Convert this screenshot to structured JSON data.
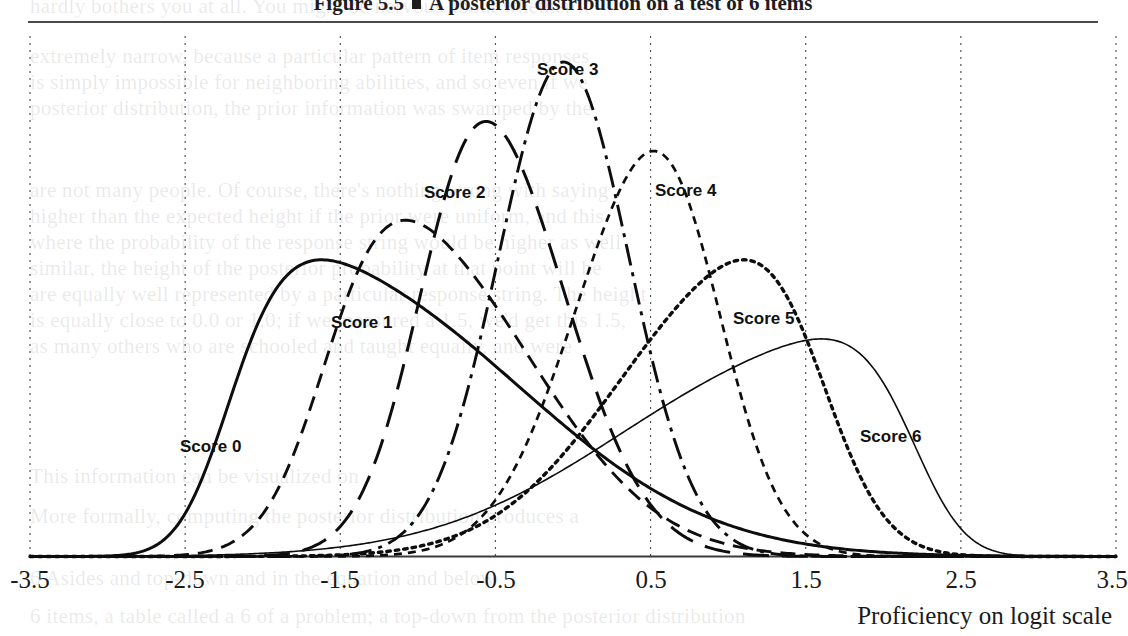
{
  "figure": {
    "number": "Figure 5.5",
    "bullet": "square-marker",
    "title": "A posterior distribution on a test of 6 items"
  },
  "axis": {
    "x_title": "Proficiency on logit scale",
    "tick_labels": [
      "-3.5",
      "-2.5",
      "-1.5",
      "-0.5",
      "0.5",
      "1.5",
      "2.5",
      "3.5"
    ]
  },
  "curve_labels": {
    "s0": "Score 0",
    "s1": "Score 1",
    "s2": "Score 2",
    "s3": "Score 3",
    "s4": "Score 4",
    "s5": "Score 5",
    "s6": "Score 6"
  },
  "bleed_text": {
    "l1": "hardly bothers you at all. You might be nervous about whether it",
    "l2": "extremely narrow, because a particular pattern of item responses",
    "l3": "is simply impossible for neighboring abilities, and so even if we",
    "l4": "posterior distribution, the prior information was swamped by the",
    "l5": "are not many people. Of course, there's nothing wrong with saying",
    "l6": "higher than the expected height if the prior were uniform, and this",
    "l7": "where the probability of the response string would be higher as well",
    "l8": "similar, the height of the posterior probability at that point will be",
    "l9": "are equally well represented by a particular response string. The height",
    "l10": "is equally close to 0.0 or 1.0; if we measured a 1.5, we'd get this 1.5,",
    "l11": "as many others who are schooled and taught equally, and were",
    "l12": "This information can be visualized on",
    "l13": "More formally, computing the posterior distribution produces a",
    "l14": "6 Asides and top-down and in the equation and below",
    "l15": "6 items, a table called a 6 of a problem; a top-down from the posterior distribution"
  },
  "chart_data": {
    "type": "line",
    "title": "A posterior distribution on a test of 6 items",
    "xlabel": "Proficiency on logit scale",
    "ylabel": "",
    "xlim": [
      -3.5,
      3.5
    ],
    "ylim": [
      0,
      1
    ],
    "grid": true,
    "legend": "inline-labels",
    "tick_values": [
      -3.5,
      -2.5,
      -1.5,
      -0.5,
      0.5,
      1.5,
      2.5,
      3.5
    ],
    "series": [
      {
        "name": "Score 0",
        "peak_x": -1.62,
        "peak_y": 0.6,
        "sigma": 0.8,
        "skew": 0.55,
        "style": "solid"
      },
      {
        "name": "Score 1",
        "peak_x": -1.08,
        "peak_y": 0.68,
        "sigma": 0.62,
        "skew": 0.3,
        "style": "dashed"
      },
      {
        "name": "Score 2",
        "peak_x": -0.56,
        "peak_y": 0.88,
        "sigma": 0.46,
        "skew": 0.12,
        "style": "long-dash"
      },
      {
        "name": "Score 3",
        "peak_x": -0.06,
        "peak_y": 1.0,
        "sigma": 0.42,
        "skew": 0.0,
        "style": "dash-dot"
      },
      {
        "name": "Score 4",
        "peak_x": 0.52,
        "peak_y": 0.82,
        "sigma": 0.46,
        "skew": -0.12,
        "style": "short-dash"
      },
      {
        "name": "Score 5",
        "peak_x": 1.1,
        "peak_y": 0.6,
        "sigma": 0.62,
        "skew": -0.3,
        "style": "dotted"
      },
      {
        "name": "Score 6",
        "peak_x": 1.6,
        "peak_y": 0.44,
        "sigma": 0.8,
        "skew": -0.55,
        "style": "thin-solid"
      }
    ]
  }
}
